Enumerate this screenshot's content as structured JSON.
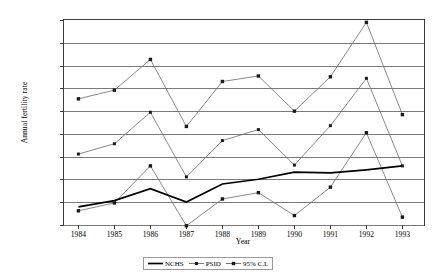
{
  "chart_data": {
    "type": "line",
    "title": "",
    "xlabel": "Year",
    "ylabel": "Annual fertility rate",
    "x": [
      1984,
      1985,
      1986,
      1987,
      1988,
      1989,
      1990,
      1991,
      1992,
      1993
    ],
    "xtick_labels": [
      "1984",
      "1985",
      "1986",
      "1987",
      "1988",
      "1989",
      "1990",
      "1991",
      "1992",
      "1993"
    ],
    "ytick_labels": [
      "0.20",
      "0.19",
      "0.17",
      "0.16",
      "0.14",
      "0.13",
      "0.11",
      "0.10",
      "0.08",
      "0.07"
    ],
    "ytick_values": [
      0.2,
      0.1856,
      0.1711,
      0.1567,
      0.1422,
      0.1278,
      0.1133,
      0.0989,
      0.0844,
      0.07
    ],
    "ylim": [
      0.07,
      0.2
    ],
    "xlim": [
      1983.6,
      1993.6
    ],
    "grid": "horizontal",
    "legend_position": "bottom-center",
    "series": [
      {
        "name": "NCHS",
        "marker": "none",
        "line": "thick-solid-black",
        "values": [
          0.0815,
          0.0855,
          0.093,
          0.0845,
          0.096,
          0.099,
          0.1035,
          0.103,
          0.105,
          0.1075
        ]
      },
      {
        "name": "PSID",
        "marker": "small-square",
        "line": "thin-solid-gray",
        "values": [
          0.115,
          0.1215,
          0.1415,
          0.1005,
          0.1235,
          0.1305,
          0.108,
          0.133,
          0.163,
          0.1075
        ]
      },
      {
        "name": "95% C.I.",
        "marker": "square",
        "line": "thin-solid-gray",
        "bounds": "upper-and-lower",
        "upper": [
          0.15,
          0.1555,
          0.175,
          0.1325,
          0.161,
          0.1645,
          0.1422,
          0.164,
          0.1985,
          0.14
        ],
        "lower": [
          0.079,
          0.084,
          0.1075,
          0.0695,
          0.0865,
          0.0905,
          0.076,
          0.094,
          0.1285,
          0.075
        ]
      }
    ]
  },
  "legend": {
    "items": [
      {
        "label": "NCHS",
        "key": "thick-line-key"
      },
      {
        "label": "PSID",
        "key": "line-small-square-key"
      },
      {
        "label": "95% C.I.",
        "key": "line-square-key"
      }
    ]
  },
  "colors": {
    "axis": "#3d3d3d",
    "gridline": "#7a7a7a",
    "series_line": "#6b6b6b",
    "nchs_line": "#000000",
    "marker_fill": "#1a1a1a",
    "background": "#ffffff"
  }
}
